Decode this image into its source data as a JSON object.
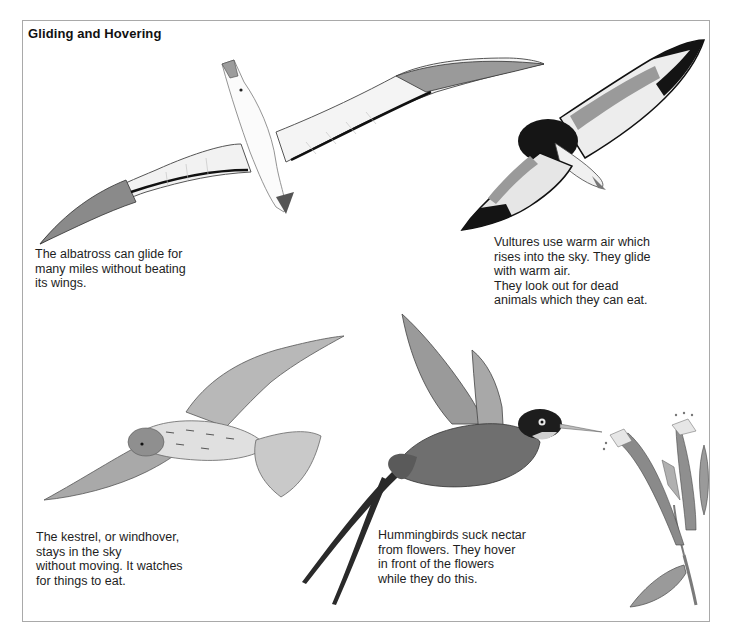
{
  "page": {
    "title": "Gliding and Hovering"
  },
  "sections": {
    "albatross": {
      "illustration": "albatross-gliding",
      "caption": "The albatross can glide for\nmany miles without beating\nits wings."
    },
    "vulture": {
      "illustration": "vulture-soaring",
      "caption": "Vultures use warm air which\nrises into the sky. They glide\nwith warm air.\nThey look out for dead\nanimals which they can eat."
    },
    "kestrel": {
      "illustration": "kestrel-hovering",
      "caption": "The kestrel, or windhover,\nstays in the sky\nwithout moving. It watches\nfor things to eat."
    },
    "hummingbird": {
      "illustration": "hummingbird-feeding",
      "caption": "Hummingbirds suck nectar\nfrom flowers. They hover\nin front of the flowers\nwhile they do this."
    },
    "flower": {
      "illustration": "tubular-flower-sprig"
    }
  },
  "colors": {
    "frame_border": "#a9a9a9",
    "text": "#1e1e1e",
    "ink_dark": "#1c1c1c",
    "ink_mid": "#7a7a7a",
    "ink_light": "#c8c8c8"
  }
}
